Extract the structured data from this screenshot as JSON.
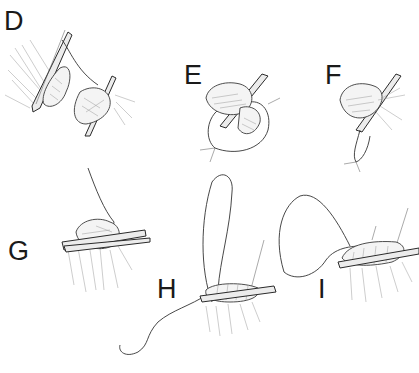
{
  "figure": {
    "type": "surgical technique illustration",
    "panels": [
      {
        "label": "D",
        "description": "Tissue grasped by two clamps with suture passed between"
      },
      {
        "label": "E",
        "description": "Tissue stump in clamp with suture loop encircling"
      },
      {
        "label": "F",
        "description": "Tissue stump in clamp with suture ends tied below"
      },
      {
        "label": "G",
        "description": "Tissue crushed in clamp with suture strand emerging"
      },
      {
        "label": "H",
        "description": "Running suture wrapped around clamped tissue with long loop and needle"
      },
      {
        "label": "I",
        "description": "Completed running suture coils over clamp with loop of suture"
      }
    ]
  },
  "colors": {
    "background": "#ffffff",
    "ink": "#1a1a1a"
  }
}
